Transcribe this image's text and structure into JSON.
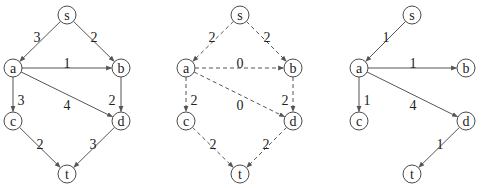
{
  "graphs": [
    {
      "id": "g1",
      "style": "solid",
      "nodes": [
        {
          "id": "s",
          "label": "s",
          "x": 67,
          "y": 15
        },
        {
          "id": "a",
          "label": "a",
          "x": 13,
          "y": 68
        },
        {
          "id": "b",
          "label": "b",
          "x": 121,
          "y": 68
        },
        {
          "id": "c",
          "label": "c",
          "x": 13,
          "y": 121
        },
        {
          "id": "d",
          "label": "d",
          "x": 121,
          "y": 121
        },
        {
          "id": "t",
          "label": "t",
          "x": 67,
          "y": 174
        }
      ],
      "edges": [
        {
          "from": "s",
          "to": "a",
          "weight": "3",
          "lx": 37,
          "ly": 37
        },
        {
          "from": "s",
          "to": "b",
          "weight": "2",
          "lx": 94,
          "ly": 37
        },
        {
          "from": "a",
          "to": "b",
          "weight": "1",
          "lx": 67,
          "ly": 63
        },
        {
          "from": "a",
          "to": "c",
          "weight": "3",
          "lx": 21,
          "ly": 100
        },
        {
          "from": "a",
          "to": "d",
          "weight": "4",
          "lx": 67,
          "ly": 105
        },
        {
          "from": "b",
          "to": "d",
          "weight": "2",
          "lx": 112,
          "ly": 100
        },
        {
          "from": "c",
          "to": "t",
          "weight": "2",
          "lx": 40,
          "ly": 144
        },
        {
          "from": "d",
          "to": "t",
          "weight": "3",
          "lx": 93,
          "ly": 144
        }
      ]
    },
    {
      "id": "g2",
      "style": "dashed",
      "nodes": [
        {
          "id": "s",
          "label": "s",
          "x": 240,
          "y": 15
        },
        {
          "id": "a",
          "label": "a",
          "x": 186,
          "y": 68
        },
        {
          "id": "b",
          "label": "b",
          "x": 293,
          "y": 68
        },
        {
          "id": "c",
          "label": "c",
          "x": 186,
          "y": 121
        },
        {
          "id": "d",
          "label": "d",
          "x": 293,
          "y": 121
        },
        {
          "id": "t",
          "label": "t",
          "x": 240,
          "y": 174
        }
      ],
      "edges": [
        {
          "from": "s",
          "to": "a",
          "weight": "2",
          "lx": 212,
          "ly": 37
        },
        {
          "from": "s",
          "to": "b",
          "weight": "2",
          "lx": 267,
          "ly": 37
        },
        {
          "from": "a",
          "to": "b",
          "weight": "0",
          "lx": 240,
          "ly": 63
        },
        {
          "from": "a",
          "to": "c",
          "weight": "2",
          "lx": 194,
          "ly": 100
        },
        {
          "from": "a",
          "to": "d",
          "weight": "0",
          "lx": 240,
          "ly": 105
        },
        {
          "from": "b",
          "to": "d",
          "weight": "2",
          "lx": 285,
          "ly": 100
        },
        {
          "from": "c",
          "to": "t",
          "weight": "2",
          "lx": 213,
          "ly": 144
        },
        {
          "from": "d",
          "to": "t",
          "weight": "2",
          "lx": 266,
          "ly": 144
        }
      ]
    },
    {
      "id": "g3",
      "style": "solid",
      "nodes": [
        {
          "id": "s",
          "label": "s",
          "x": 412,
          "y": 15
        },
        {
          "id": "a",
          "label": "a",
          "x": 359,
          "y": 68
        },
        {
          "id": "b",
          "label": "b",
          "x": 466,
          "y": 68
        },
        {
          "id": "c",
          "label": "c",
          "x": 359,
          "y": 121
        },
        {
          "id": "d",
          "label": "d",
          "x": 466,
          "y": 121
        },
        {
          "id": "t",
          "label": "t",
          "x": 412,
          "y": 174
        }
      ],
      "edges": [
        {
          "from": "s",
          "to": "a",
          "weight": "1",
          "lx": 386,
          "ly": 37
        },
        {
          "from": "a",
          "to": "b",
          "weight": "1",
          "lx": 413,
          "ly": 63
        },
        {
          "from": "a",
          "to": "c",
          "weight": "1",
          "lx": 367,
          "ly": 100
        },
        {
          "from": "a",
          "to": "d",
          "weight": "4",
          "lx": 413,
          "ly": 105
        },
        {
          "from": "d",
          "to": "t",
          "weight": "1",
          "lx": 440,
          "ly": 144
        }
      ]
    }
  ],
  "node_radius": 9,
  "colors": {
    "stroke": "#555555",
    "text": "#222222"
  }
}
